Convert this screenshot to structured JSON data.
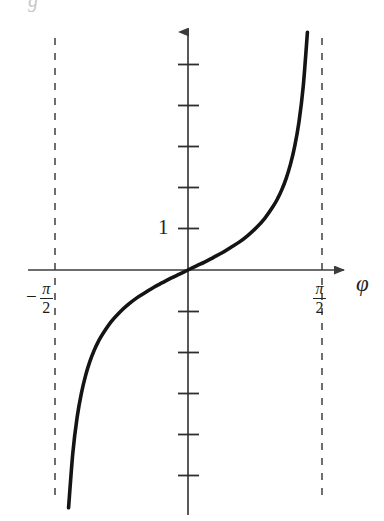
{
  "figure": {
    "background_color": "#ffffff",
    "ink_color": "#1a1a1a",
    "axis_color": "#3c3c3c",
    "asymptote_color": "#4a4a4a",
    "corner_fragment": "g"
  },
  "labels": {
    "y_tick_one": "1",
    "x_axis_label": "φ",
    "left_asymptote": {
      "sign": "−",
      "numerator": "π",
      "denominator": "2"
    },
    "right_asymptote": {
      "sign": "",
      "numerator": "π",
      "denominator": "2"
    }
  },
  "chart_data": {
    "type": "line",
    "title": "",
    "subtitle": "",
    "xlabel": "φ",
    "ylabel": "",
    "function": "tan(φ)",
    "xlim": [
      -1.5707963,
      1.5707963
    ],
    "ylim": [
      -6,
      6
    ],
    "grid": false,
    "legend": null,
    "x_ticks": [],
    "x_tick_labels": [
      "-π/2",
      "π/2"
    ],
    "x_tick_values": [
      -1.5707963,
      1.5707963
    ],
    "y_ticks": [
      -5,
      -4,
      -3,
      -2,
      -1,
      1,
      2,
      3,
      4,
      5
    ],
    "y_tick_labels": [
      "",
      "",
      "",
      "",
      "",
      "1",
      "",
      "",
      "",
      ""
    ],
    "labeled_y_value": 1,
    "asymptotes": [
      -1.5707963,
      1.5707963
    ],
    "asymptote_style": "dashed",
    "series": [
      {
        "name": "tan(φ)",
        "x": [
          -1.452,
          -1.4,
          -1.35,
          -1.3,
          -1.25,
          -1.2,
          -1.15,
          -1.1,
          -1.05,
          -1.0,
          -0.9,
          -0.8,
          -0.7,
          -0.6,
          -0.5,
          -0.4,
          -0.3,
          -0.2,
          -0.1,
          0.0,
          0.1,
          0.2,
          0.3,
          0.4,
          0.5,
          0.6,
          0.7,
          0.8,
          0.9,
          1.0,
          1.05,
          1.1,
          1.15,
          1.2,
          1.25,
          1.3,
          1.35,
          1.4,
          1.452
        ],
        "y": [
          -8.24,
          -5.8,
          -4.46,
          -3.6,
          -3.01,
          -2.57,
          -2.23,
          -1.96,
          -1.74,
          -1.56,
          -1.26,
          -1.03,
          -0.84,
          -0.68,
          -0.55,
          -0.42,
          -0.31,
          -0.2,
          -0.1,
          0.0,
          0.1,
          0.2,
          0.31,
          0.42,
          0.55,
          0.68,
          0.84,
          1.03,
          1.26,
          1.56,
          1.74,
          1.96,
          2.23,
          2.57,
          3.01,
          3.6,
          4.46,
          5.8,
          8.24
        ]
      }
    ]
  },
  "geometry": {
    "origin_x": 188,
    "origin_y": 270,
    "unit_y_px": 41,
    "x_axis_left": 28,
    "x_axis_right": 350,
    "y_axis_top": 25,
    "y_axis_bottom": 515,
    "left_asymptote_x": 55,
    "right_asymptote_x": 322,
    "asymptote_top": 38,
    "asymptote_bottom": 496
  }
}
